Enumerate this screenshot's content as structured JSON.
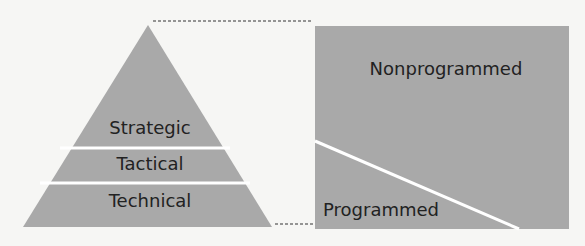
{
  "diagram": {
    "pyramid": {
      "levels": [
        {
          "label": "Strategic"
        },
        {
          "label": "Tactical"
        },
        {
          "label": "Technical"
        }
      ]
    },
    "decision_box": {
      "upper_label": "Nonprogrammed",
      "lower_label": "Programmed"
    },
    "colors": {
      "fill": "#a9a9a9",
      "separator": "#ffffff",
      "text": "#222222",
      "dash": "#333333",
      "background": "#f6f6f4"
    }
  }
}
